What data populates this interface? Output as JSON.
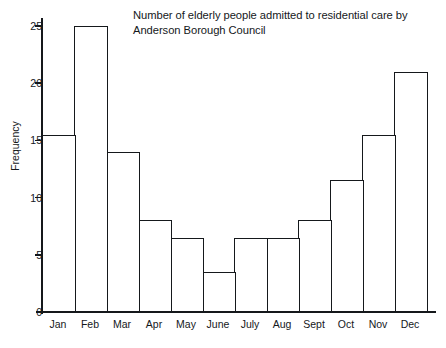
{
  "chart_data": {
    "type": "bar",
    "title": "Number of elderly people admitted to residential care by\nAnderson Borough Council",
    "xlabel": "",
    "ylabel": "Frequency",
    "categories": [
      "Jan",
      "Feb",
      "Mar",
      "Apr",
      "May",
      "June",
      "July",
      "Aug",
      "Sept",
      "Oct",
      "Nov",
      "Dec"
    ],
    "values": [
      15.5,
      25,
      14,
      8,
      6.5,
      3.5,
      6.5,
      6.5,
      8,
      11.5,
      15.5,
      21
    ],
    "ylim": [
      0,
      26
    ],
    "yticks": [
      0,
      5,
      10,
      15,
      20,
      25
    ],
    "ytick_labels": [
      "0",
      "5",
      "10",
      "15",
      "20",
      "25"
    ],
    "grid": false,
    "legend": null,
    "bar_style": {
      "fill": "#ffffff",
      "edge": "#15181b",
      "gap": 0
    }
  }
}
